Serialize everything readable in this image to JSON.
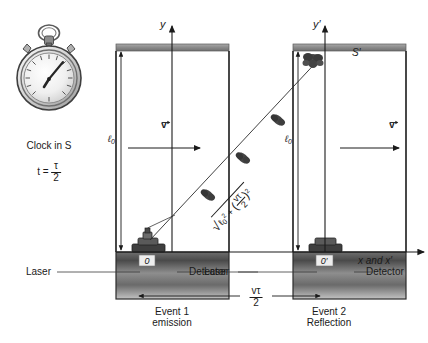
{
  "figure": {
    "colors": {
      "ink": "#1a1a1a",
      "bar_top": "#8f8f8f",
      "bar_base_dark": "#3a3a3a",
      "bar_base_light": "#b8b8b8",
      "device": "#4a4a4a",
      "pulse": "#3d3d3d"
    }
  },
  "clock": {
    "caption": "Clock in",
    "frame": "S",
    "time_label": "t =",
    "time_numerator": "τ",
    "time_denominator": "2",
    "icon": "stopwatch-icon"
  },
  "axes": {
    "y_left": "y",
    "y_right": "y′",
    "x_label": "x and x′",
    "frame_prime": "S′"
  },
  "left_box": {
    "height_label": "ℓ",
    "height_sub": "0",
    "origin": "0",
    "laser": "Laser",
    "detector": "Detector",
    "event_line1": "Event 1",
    "event_line2": "emission"
  },
  "right_box": {
    "height_label": "ℓ",
    "height_sub": "0",
    "origin": "0′",
    "laser": "Laser",
    "detector": "Detector",
    "event_line1": "Event 2",
    "event_line2": "Reflection"
  },
  "velocity": {
    "symbol": "v",
    "left_arrow_name": "velocity-vector-left",
    "right_arrow_name": "velocity-vector-right"
  },
  "separation": {
    "numerator": "vτ",
    "denominator": "2"
  },
  "path_formula": {
    "radicand_a": "ℓ",
    "radicand_a_sub": "0",
    "radicand_a_sup": "2",
    "plus": "+",
    "frac_num": "vτ",
    "frac_den": "2",
    "frac_sup": "2"
  }
}
